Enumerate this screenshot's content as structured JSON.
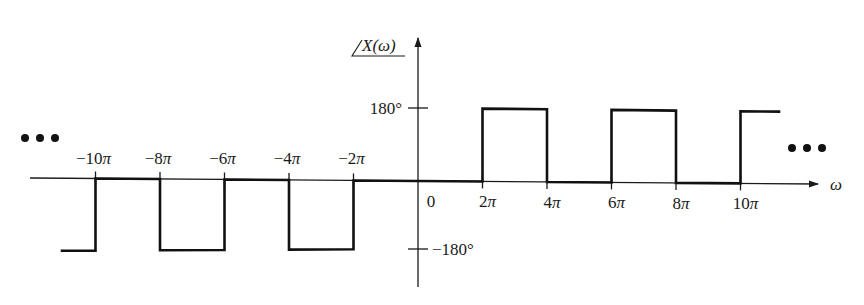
{
  "chart_data": {
    "type": "line",
    "title": "",
    "ylabel": "∠X(ω)",
    "xlabel": "ω",
    "step": true,
    "y_ticks": [
      {
        "value": 180,
        "label": "180°"
      },
      {
        "value": -180,
        "label": "−180°"
      }
    ],
    "x_ticks": [
      {
        "value": -10,
        "label": "−10π"
      },
      {
        "value": -8,
        "label": "−8π"
      },
      {
        "value": -6,
        "label": "−6π"
      },
      {
        "value": -4,
        "label": "−4π"
      },
      {
        "value": -2,
        "label": "−2π"
      },
      {
        "value": 0,
        "label": "0"
      },
      {
        "value": 2,
        "label": "2π"
      },
      {
        "value": 4,
        "label": "4π"
      },
      {
        "value": 6,
        "label": "6π"
      },
      {
        "value": 8,
        "label": "8π"
      },
      {
        "value": 10,
        "label": "10π"
      }
    ],
    "x_unit": "π",
    "segments": [
      {
        "x_start": -11,
        "x_end": -10,
        "y": -180
      },
      {
        "x_start": -10,
        "x_end": -8,
        "y": 0
      },
      {
        "x_start": -8,
        "x_end": -6,
        "y": -180
      },
      {
        "x_start": -6,
        "x_end": -4,
        "y": 0
      },
      {
        "x_start": -4,
        "x_end": -2,
        "y": -180
      },
      {
        "x_start": -2,
        "x_end": 2,
        "y": 0
      },
      {
        "x_start": 2,
        "x_end": 4,
        "y": 180
      },
      {
        "x_start": 4,
        "x_end": 6,
        "y": 0
      },
      {
        "x_start": 6,
        "x_end": 8,
        "y": 180
      },
      {
        "x_start": 8,
        "x_end": 10,
        "y": 0
      },
      {
        "x_start": 10,
        "x_end": 11,
        "y": 180
      }
    ],
    "continuation": "…",
    "ylim": [
      -180,
      180
    ],
    "grid": false,
    "legend": null
  },
  "labels": {
    "ylabel_core": "X(ω)",
    "xlabel": "ω",
    "ellipsis": "•••"
  }
}
